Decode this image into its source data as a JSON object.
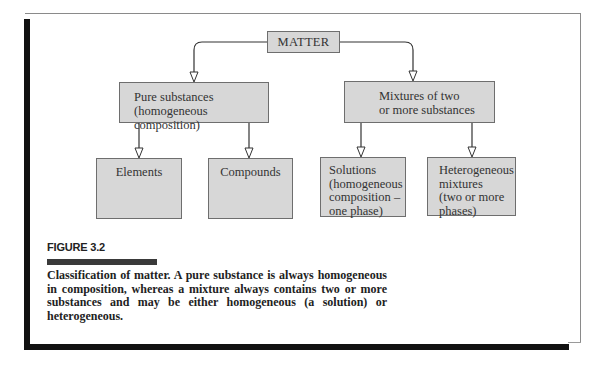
{
  "diagram": {
    "root": {
      "label": "MATTER"
    },
    "level1": [
      {
        "id": "pure",
        "label": "Pure substances\n(homogeneous composition)"
      },
      {
        "id": "mixtures",
        "label": "Mixtures of two\nor more substances"
      }
    ],
    "level2": [
      {
        "id": "elements",
        "parent": "pure",
        "label": "Elements"
      },
      {
        "id": "compounds",
        "parent": "pure",
        "label": "Compounds"
      },
      {
        "id": "solutions",
        "parent": "mixtures",
        "label": "Solutions\n(homogeneous\ncomposition –\none phase)"
      },
      {
        "id": "hetero",
        "parent": "mixtures",
        "label": "Heterogeneous\nmixtures\n(two or more\nphases)"
      }
    ],
    "colors": {
      "box_fill": "#d7d7d7",
      "box_border": "#6e6e6e",
      "connector": "#333333",
      "frame_bar": "#111111",
      "figure_bar": "#3a3a3a"
    }
  },
  "figure": {
    "label": "FIGURE 3.2",
    "caption": "Classification of matter. A pure substance is always homogeneous in composition, whereas a mixture always contains two or more substances and may be either homogeneous (a solution) or heterogeneous."
  }
}
